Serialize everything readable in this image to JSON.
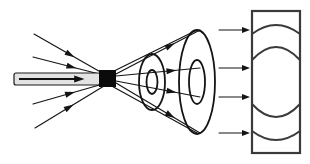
{
  "figure": {
    "background_color": "#ffffff",
    "line_color": "#141414",
    "screen_color": "#3a3a3a",
    "source_color": "#0b0b0b",
    "probe_body_color": "#e3e3e3",
    "width": 310,
    "height": 164
  },
  "probe": {
    "name": "probe-catheter",
    "label": "",
    "x": 14,
    "y": 73,
    "width": 86,
    "height": 12,
    "inner_arrow_label": ""
  },
  "source": {
    "name": "point-source-block",
    "label": "",
    "x": 99,
    "y": 70,
    "width": 17,
    "height": 17
  },
  "incoming_rays": [
    {
      "name": "incoming-ray-1",
      "x1": 34,
      "y1": 34,
      "x2": 104,
      "y2": 74,
      "arrow_t": 0.58
    },
    {
      "name": "incoming-ray-2",
      "x1": 33,
      "y1": 57,
      "x2": 103,
      "y2": 75,
      "arrow_t": 0.62
    },
    {
      "name": "incoming-ray-3",
      "x1": 33,
      "y1": 104,
      "x2": 103,
      "y2": 84,
      "arrow_t": 0.6
    },
    {
      "name": "incoming-ray-4",
      "x1": 35,
      "y1": 128,
      "x2": 104,
      "y2": 86,
      "arrow_t": 0.56
    }
  ],
  "outgoing_rays": [
    {
      "name": "outgoing-ray-1",
      "x1": 116,
      "y1": 74,
      "x2": 200,
      "y2": 30,
      "arrow_t": 0.7
    },
    {
      "name": "outgoing-ray-2",
      "x1": 116,
      "y1": 76,
      "x2": 200,
      "y2": 68,
      "arrow_t": 0.72
    },
    {
      "name": "outgoing-ray-3",
      "x1": 116,
      "y1": 81,
      "x2": 200,
      "y2": 97,
      "arrow_t": 0.72
    },
    {
      "name": "outgoing-ray-4",
      "x1": 116,
      "y1": 83,
      "x2": 200,
      "y2": 133,
      "arrow_t": 0.7
    }
  ],
  "cone_edges": [
    {
      "name": "cone-edge-top",
      "x1": 108,
      "y1": 74,
      "x2": 197,
      "y2": 30
    },
    {
      "name": "cone-edge-bottom",
      "x1": 108,
      "y1": 84,
      "x2": 197,
      "y2": 133
    }
  ],
  "wavefronts": [
    {
      "name": "wavefront-near",
      "cx": 152,
      "cy": 82,
      "rx": 13,
      "ry": 28,
      "inner_rx": 5.5,
      "inner_ry": 12
    },
    {
      "name": "wavefront-far",
      "cx": 197,
      "cy": 82,
      "rx": 18,
      "ry": 52,
      "inner_rx": 8,
      "inner_ry": 22
    }
  ],
  "screen_arrows": [
    {
      "name": "screen-arrow-1",
      "x1": 219,
      "y1": 30,
      "x2": 250,
      "y2": 30
    },
    {
      "name": "screen-arrow-2",
      "x1": 219,
      "y1": 68,
      "x2": 250,
      "y2": 68
    },
    {
      "name": "screen-arrow-3",
      "x1": 219,
      "y1": 97,
      "x2": 250,
      "y2": 97
    },
    {
      "name": "screen-arrow-4",
      "x1": 219,
      "y1": 133,
      "x2": 250,
      "y2": 133
    }
  ],
  "screen": {
    "name": "detector-screen",
    "x": 252,
    "y": 11,
    "width": 48,
    "height": 142,
    "arcs": [
      {
        "name": "screen-arc-1",
        "y": 34,
        "bulge": -9
      },
      {
        "name": "screen-arc-2",
        "y": 60,
        "bulge": -13
      },
      {
        "name": "screen-arc-3",
        "y": 104,
        "bulge": 13
      },
      {
        "name": "screen-arc-4",
        "y": 131,
        "bulge": 9
      }
    ]
  }
}
